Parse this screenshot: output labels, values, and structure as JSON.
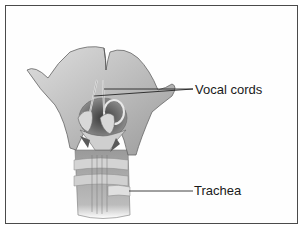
{
  "figure": {
    "labels": [
      {
        "id": "vocal-cords",
        "text": "Vocal cords"
      },
      {
        "id": "trachea",
        "text": "Trachea"
      }
    ]
  },
  "colors": {
    "frame_border": "#4a4a4a",
    "background": "#ffffff",
    "cartilage_fill": "#c9c9c9",
    "shadow": "#6e6e6e",
    "leader_line": "#111111",
    "label_text": "#1a1a1a"
  }
}
